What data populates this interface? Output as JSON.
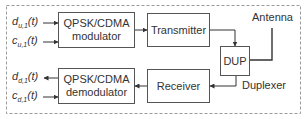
{
  "diagram": {
    "title": "",
    "frame": {
      "style": "dashed",
      "color": "#999999"
    },
    "blocks": {
      "modulator": {
        "line1": "QPSK/CDMA",
        "line2": "modulator"
      },
      "transmitter": {
        "label": "Transmitter"
      },
      "dup": {
        "label": "DUP"
      },
      "demodulator": {
        "line1": "QPSK/CDMA",
        "line2": "demodulator"
      },
      "receiver": {
        "label": "Receiver"
      }
    },
    "labels": {
      "antenna": "Antenna",
      "duplexer": "Duplexer"
    },
    "signals": {
      "d_u1": {
        "base": "d",
        "sub": "u,1",
        "arg": "(t)",
        "direction": "input"
      },
      "c_u1": {
        "base": "c",
        "sub": "u,1",
        "arg": "(t)",
        "direction": "input"
      },
      "d_d1": {
        "base": "d",
        "sub": "d,1",
        "arg": "(t)",
        "direction": "output"
      },
      "c_d1": {
        "base": "c",
        "sub": "d,1",
        "arg": "(t)",
        "direction": "input"
      }
    },
    "connections": [
      {
        "from": "d_u1",
        "to": "modulator"
      },
      {
        "from": "c_u1",
        "to": "modulator"
      },
      {
        "from": "modulator",
        "to": "transmitter"
      },
      {
        "from": "transmitter",
        "to": "dup"
      },
      {
        "from": "dup",
        "to": "antenna"
      },
      {
        "from": "dup",
        "to": "receiver"
      },
      {
        "from": "receiver",
        "to": "demodulator"
      },
      {
        "from": "demodulator",
        "to": "d_d1"
      },
      {
        "from": "c_d1",
        "to": "demodulator"
      }
    ]
  }
}
